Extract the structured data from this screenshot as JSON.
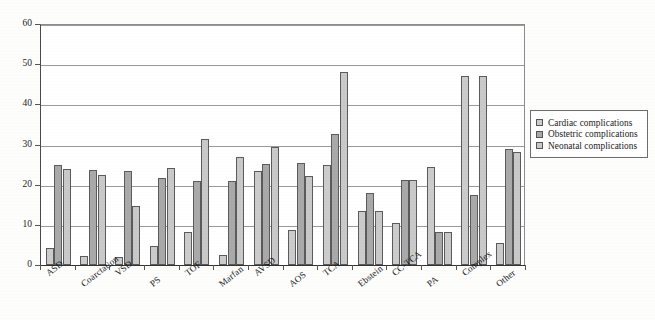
{
  "chart_data": {
    "type": "bar",
    "title": "",
    "xlabel": "",
    "ylabel": "",
    "ylim": [
      0,
      60
    ],
    "yticks": [
      0,
      10,
      20,
      30,
      40,
      50,
      60
    ],
    "grid": true,
    "legend_position": "right",
    "categories": [
      "ASD",
      "Coarctation",
      "VSD",
      "PS",
      "TOF",
      "Marfan",
      "AVSD",
      "AOS",
      "TCA",
      "Ebstein",
      "CC-TCA",
      "PA",
      "Complex",
      "Other"
    ],
    "series": [
      {
        "name": "Cardiac complications",
        "color": "#cccccc",
        "values": [
          4.2,
          2.3,
          2.0,
          4.7,
          8.1,
          2.5,
          23.3,
          8.6,
          24.8,
          13.5,
          10.5,
          24.5,
          47.0,
          5.5
        ]
      },
      {
        "name": "Obstetric complications",
        "color": "#a9a9a9",
        "values": [
          24.9,
          23.6,
          23.5,
          21.6,
          20.8,
          21.0,
          25.2,
          25.4,
          32.6,
          18.0,
          21.1,
          8.3,
          17.5,
          29.0
        ]
      },
      {
        "name": "Neonatal complications",
        "color": "#c9c9c9",
        "values": [
          23.8,
          22.5,
          14.7,
          24.2,
          31.4,
          27.0,
          29.3,
          22.2,
          48.0,
          13.5,
          21.1,
          8.3,
          47.0,
          28.2
        ]
      }
    ]
  },
  "legend": {
    "items": [
      {
        "label": "Cardiac complications"
      },
      {
        "label": "Obstetric complications"
      },
      {
        "label": "Neonatal complications"
      }
    ]
  }
}
